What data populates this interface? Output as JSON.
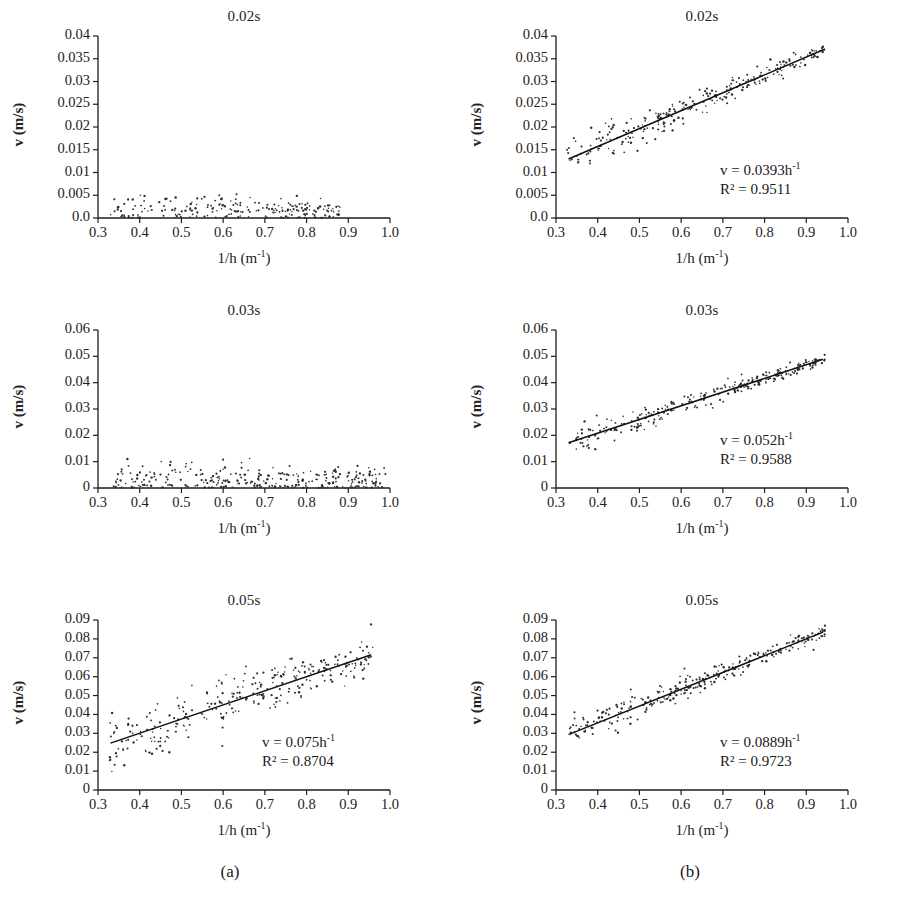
{
  "figure": {
    "width": 914,
    "height": 900,
    "background": "#ffffff",
    "ink": "#1a1a1a",
    "columns": [
      {
        "key": "a",
        "caption": "(a)",
        "caption_x": 230,
        "caption_y": 862
      },
      {
        "key": "b",
        "caption": "(b)",
        "caption_x": 690,
        "caption_y": 862
      }
    ]
  },
  "common": {
    "xlabel": "1/h (m",
    "xlabel_sup": "-1",
    "xlabel_tail": ")",
    "ylabel": "v (m/s)",
    "xticks": [
      "0.3",
      "0.4",
      "0.5",
      "0.6",
      "0.7",
      "0.8",
      "0.9",
      "1.0"
    ],
    "xlim": [
      0.3,
      1.0
    ]
  },
  "chart_data": [
    {
      "id": "a-002",
      "type": "scatter",
      "panel": {
        "col": "a",
        "row": 0
      },
      "title": "0.02s",
      "xlabel": "1/h (m-1)",
      "ylabel": "v (m/s)",
      "xlim": [
        0.3,
        1.0
      ],
      "ylim": [
        0.0,
        0.04
      ],
      "yticks": [
        "0.0",
        "0.005",
        "0.01",
        "0.015",
        "0.02",
        "0.025",
        "0.03",
        "0.035",
        "0.04"
      ],
      "ytick_values": [
        0.0,
        0.005,
        0.01,
        0.015,
        0.02,
        0.025,
        0.03,
        0.035,
        0.04
      ],
      "grid": false,
      "has_fit_line": false,
      "equation": null,
      "r_squared": null,
      "scatter": {
        "n": 210,
        "x_range": [
          0.33,
          0.88
        ],
        "model": "noise-near-zero",
        "base": 0.0012,
        "amplitude_at_xmin": 0.0048,
        "amplitude_at_xmax": 0.0018,
        "seed": 11
      }
    },
    {
      "id": "b-002",
      "type": "scatter",
      "panel": {
        "col": "b",
        "row": 0
      },
      "title": "0.02s",
      "xlabel": "1/h (m-1)",
      "ylabel": "v (m/s)",
      "xlim": [
        0.3,
        1.0
      ],
      "ylim": [
        0.0,
        0.04
      ],
      "yticks": [
        "0.0",
        "0.005",
        "0.01",
        "0.015",
        "0.02",
        "0.025",
        "0.03",
        "0.035",
        "0.04"
      ],
      "ytick_values": [
        0.0,
        0.005,
        0.01,
        0.015,
        0.02,
        0.025,
        0.03,
        0.035,
        0.04
      ],
      "grid": false,
      "has_fit_line": true,
      "equation": "v = 0.0393h",
      "equation_sup": "-1",
      "r_squared_label": "R² = 0.9511",
      "r_squared": 0.9511,
      "slope": 0.0393,
      "intercept": 0.0,
      "fit_x": [
        0.33,
        0.945
      ],
      "fit_y": [
        0.01297,
        0.03714
      ],
      "scatter": {
        "n": 260,
        "x_range": [
          0.325,
          0.945
        ],
        "model": "linear-with-noise",
        "noise_at_xmin": 0.0022,
        "noise_at_xmax": 0.0007,
        "seed": 23
      }
    },
    {
      "id": "a-003",
      "type": "scatter",
      "panel": {
        "col": "a",
        "row": 1
      },
      "title": "0.03s",
      "xlabel": "1/h (m-1)",
      "ylabel": "v (m/s)",
      "xlim": [
        0.3,
        1.0
      ],
      "ylim": [
        0.0,
        0.06
      ],
      "yticks": [
        "0",
        "0.01",
        "0.02",
        "0.03",
        "0.04",
        "0.05",
        "0.06"
      ],
      "ytick_values": [
        0.0,
        0.01,
        0.02,
        0.03,
        0.04,
        0.05,
        0.06
      ],
      "grid": false,
      "has_fit_line": false,
      "equation": null,
      "r_squared": null,
      "scatter": {
        "n": 300,
        "x_range": [
          0.335,
          0.99
        ],
        "model": "noise-near-zero",
        "base": 0.0016,
        "amplitude_at_xmin": 0.0075,
        "amplitude_at_xmax": 0.0058,
        "seed": 37
      }
    },
    {
      "id": "b-003",
      "type": "scatter",
      "panel": {
        "col": "b",
        "row": 1
      },
      "title": "0.03s",
      "xlabel": "1/h (m-1)",
      "ylabel": "v (m/s)",
      "xlim": [
        0.3,
        1.0
      ],
      "ylim": [
        0.0,
        0.06
      ],
      "yticks": [
        "0",
        "0.01",
        "0.02",
        "0.03",
        "0.04",
        "0.05",
        "0.06"
      ],
      "ytick_values": [
        0.0,
        0.01,
        0.02,
        0.03,
        0.04,
        0.05,
        0.06
      ],
      "grid": false,
      "has_fit_line": true,
      "equation": "v = 0.052h",
      "equation_sup": "-1",
      "r_squared_label": "R² = 0.9588",
      "r_squared": 0.9588,
      "slope": 0.052,
      "intercept": 0.0,
      "fit_x": [
        0.33,
        0.94
      ],
      "fit_y": [
        0.01716,
        0.04888
      ],
      "scatter": {
        "n": 270,
        "x_range": [
          0.33,
          0.945
        ],
        "model": "linear-with-noise",
        "noise_at_xmin": 0.0028,
        "noise_at_xmax": 0.0009,
        "seed": 59
      }
    },
    {
      "id": "a-005",
      "type": "scatter",
      "panel": {
        "col": "a",
        "row": 2
      },
      "title": "0.05s",
      "xlabel": "1/h (m-1)",
      "ylabel": "v (m/s)",
      "xlim": [
        0.3,
        1.0
      ],
      "ylim": [
        0.0,
        0.09
      ],
      "yticks": [
        "0",
        "0.01",
        "0.02",
        "0.03",
        "0.04",
        "0.05",
        "0.06",
        "0.07",
        "0.08",
        "0.09"
      ],
      "ytick_values": [
        0.0,
        0.01,
        0.02,
        0.03,
        0.04,
        0.05,
        0.06,
        0.07,
        0.08,
        0.09
      ],
      "grid": false,
      "has_fit_line": true,
      "equation": "v = 0.075h",
      "equation_sup": "-1",
      "r_squared_label": "R² = 0.8704",
      "r_squared": 0.8704,
      "slope": 0.075,
      "intercept": 0.0,
      "fit_x": [
        0.33,
        0.955
      ],
      "fit_y": [
        0.0248,
        0.0716
      ],
      "scatter": {
        "n": 300,
        "x_range": [
          0.325,
          0.96
        ],
        "model": "linear-with-noise",
        "noise_at_xmin": 0.0082,
        "noise_at_xmax": 0.0048,
        "seed": 71
      }
    },
    {
      "id": "b-005",
      "type": "scatter",
      "panel": {
        "col": "b",
        "row": 2
      },
      "title": "0.05s",
      "xlabel": "1/h (m-1)",
      "ylabel": "v (m/s)",
      "xlim": [
        0.3,
        1.0
      ],
      "ylim": [
        0.0,
        0.09
      ],
      "yticks": [
        "0",
        "0.01",
        "0.02",
        "0.03",
        "0.04",
        "0.05",
        "0.06",
        "0.07",
        "0.08",
        "0.09"
      ],
      "ytick_values": [
        0.0,
        0.01,
        0.02,
        0.03,
        0.04,
        0.05,
        0.06,
        0.07,
        0.08,
        0.09
      ],
      "grid": false,
      "has_fit_line": true,
      "equation": "v = 0.0889h",
      "equation_sup": "-1",
      "r_squared_label": "R² = 0.9723",
      "r_squared": 0.9723,
      "slope": 0.0889,
      "intercept": 0.0,
      "fit_x": [
        0.33,
        0.94
      ],
      "fit_y": [
        0.02934,
        0.08357
      ],
      "scatter": {
        "n": 280,
        "x_range": [
          0.33,
          0.945
        ],
        "model": "linear-with-noise",
        "noise_at_xmin": 0.0042,
        "noise_at_xmax": 0.0016,
        "seed": 97
      }
    }
  ]
}
